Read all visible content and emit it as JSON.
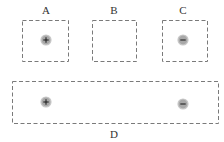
{
  "diagram": {
    "colors": {
      "box_stroke": "#7a7a7a",
      "charge_fill": "#a8a8a8",
      "charge_halo": "#c8c8c8",
      "symbol": "#222222",
      "label": "#333333"
    },
    "regions": [
      {
        "label": "A",
        "charges": [
          "+"
        ]
      },
      {
        "label": "B",
        "charges": []
      },
      {
        "label": "C",
        "charges": [
          "-"
        ]
      },
      {
        "label": "D",
        "charges": [
          "+",
          "-"
        ]
      }
    ]
  }
}
